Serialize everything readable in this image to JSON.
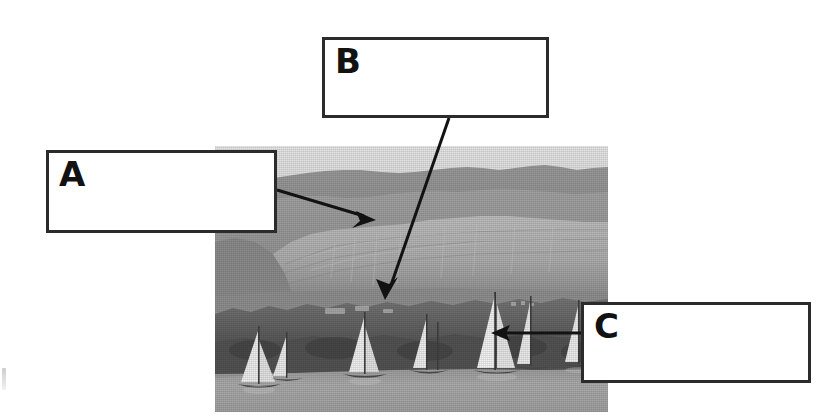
{
  "figure": {
    "type": "annotated-photograph",
    "background_color": "#ffffff",
    "photo": {
      "name": "river-landscape-photo",
      "x": 215,
      "y": 146,
      "width": 393,
      "height": 266,
      "palette": {
        "sky": "#d9d9d9",
        "far_hills": "#8f8f8f",
        "mid_hills": "#a2a2a2",
        "cliff_light": "#b9b9b9",
        "tree_band": "#6a6a6a",
        "dark_bank": "#4e4e4e",
        "water": "#a8a8a8",
        "sail_white": "#efefef"
      },
      "content_regions": [
        {
          "name": "sky",
          "label": "Sky"
        },
        {
          "name": "hills",
          "label": "Arid hills / escarpment"
        },
        {
          "name": "cliff",
          "label": "Pale cliff face"
        },
        {
          "name": "vegetation",
          "label": "Band of trees and cultivated bank"
        },
        {
          "name": "river",
          "label": "River water"
        },
        {
          "name": "boats",
          "label": "Sailing boats with triangular sails"
        }
      ],
      "boat_count": 7
    },
    "callouts": [
      {
        "id": "a",
        "label": "A",
        "box": {
          "x": 46,
          "y": 150,
          "width": 231,
          "height": 83
        },
        "text": "",
        "pointer": {
          "from_x": 277,
          "from_y": 190,
          "to_x": 374,
          "to_y": 219,
          "target": "hills"
        }
      },
      {
        "id": "b",
        "label": "B",
        "box": {
          "x": 322,
          "y": 37,
          "width": 227,
          "height": 81
        },
        "text": "",
        "pointer": {
          "from_x": 449,
          "from_y": 118,
          "to_x": 385,
          "to_y": 300,
          "target": "vegetation"
        }
      },
      {
        "id": "c",
        "label": "C",
        "box": {
          "x": 581,
          "y": 302,
          "width": 230,
          "height": 81
        },
        "text": "",
        "pointer": {
          "from_x": 581,
          "from_y": 333,
          "to_x": 492,
          "to_y": 333,
          "target": "boats"
        }
      }
    ],
    "style": {
      "box_border_color": "#2b2b2b",
      "box_fill_color": "#ffffff",
      "box_border_width": 3,
      "arrow_color": "#121212",
      "letter_color": "#121212"
    }
  }
}
